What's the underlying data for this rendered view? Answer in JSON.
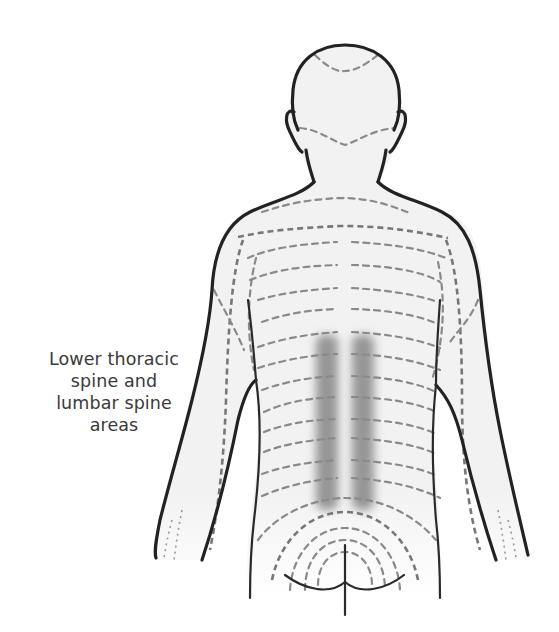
{
  "figure": {
    "label_lines": [
      "Lower thoracic",
      "spine and",
      "lumbar spine",
      "areas"
    ]
  },
  "colors": {
    "background": "#ffffff",
    "body_fill": "#f2f2f2",
    "outline": "#222222",
    "dermatome_lines": "#8a8a8a",
    "highlight_band": "#8c8c8c",
    "label_text": "#3a3a3a"
  },
  "highlight": {
    "region": "lower thoracic and lumbar spine",
    "bands": 2
  }
}
